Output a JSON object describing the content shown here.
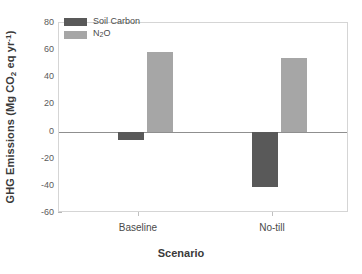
{
  "chart_data": {
    "type": "bar",
    "title": "",
    "xlabel": "Scenario",
    "ylabel": "GHG Emissions (Mg CO2 eq yr-1)",
    "ylabel_parts": {
      "pre": "GHG Emissions (Mg CO",
      "sub": "2",
      "mid": " eq yr",
      "sup": "-1",
      "post": ")"
    },
    "categories": [
      "Baseline",
      "No-till"
    ],
    "series": [
      {
        "name": "Soil Carbon",
        "color": "#595959",
        "values": [
          -6,
          -40.5
        ]
      },
      {
        "name": "N2O",
        "color": "#a6a6a6",
        "values": [
          59,
          54.5
        ]
      }
    ],
    "legend": [
      {
        "label": "Soil Carbon",
        "color": "#595959"
      },
      {
        "label_pre": "N",
        "label_sub": "2",
        "label_post": "O",
        "color": "#a6a6a6"
      }
    ],
    "ylim": [
      -60,
      80
    ],
    "yticks": [
      80,
      60,
      40,
      20,
      0,
      -20,
      -40,
      -60
    ],
    "ytick_labels": [
      "80",
      "60",
      "40",
      "20",
      "0",
      "-20",
      "-40",
      "-60"
    ],
    "grid": false,
    "legend_position": "top-left",
    "axis_color": "#d5d5d5",
    "zero_line_color": "#8f8f8f"
  },
  "legend": {
    "item0_label": "Soil Carbon",
    "item1_pre": "N",
    "item1_sub": "2",
    "item1_post": "O"
  },
  "axes": {
    "x_title": "Scenario",
    "x_tick_0": "Baseline",
    "x_tick_1": "No-till",
    "y_title_pre": "GHG Emissions (Mg CO",
    "y_title_sub": "2",
    "y_title_mid": " eq yr",
    "y_title_sup": "-1",
    "y_title_post": ")"
  }
}
